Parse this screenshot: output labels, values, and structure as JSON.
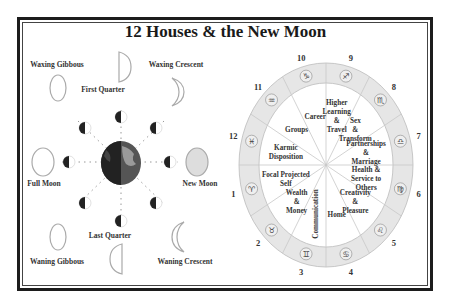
{
  "title": "12 Houses & the New Moon",
  "moon_phases": {
    "waxing_gibbous": "Waxing Gibbous",
    "first_quarter": "First Quarter",
    "waxing_crescent": "Waxing Crescent",
    "full_moon": "Full Moon",
    "new_moon": "New Moon",
    "waning_gibbous": "Waning Gibbous",
    "last_quarter": "Last Quarter",
    "waning_crescent": "Waning Crescent"
  },
  "houses": [
    {
      "number": "1",
      "sign": "♈",
      "meaning": [
        "Focal Projected",
        "Self"
      ]
    },
    {
      "number": "2",
      "sign": "♉",
      "meaning": [
        "Wealth",
        "&",
        "Money"
      ]
    },
    {
      "number": "3",
      "sign": "♊",
      "meaning": [
        "Communication"
      ]
    },
    {
      "number": "4",
      "sign": "♋",
      "meaning": [
        "Home"
      ]
    },
    {
      "number": "5",
      "sign": "♌",
      "meaning": [
        "Creativity",
        "&",
        "Pleasure"
      ]
    },
    {
      "number": "6",
      "sign": "♍",
      "meaning": [
        "Health &",
        "Service to",
        "Others"
      ]
    },
    {
      "number": "7",
      "sign": "♎",
      "meaning": [
        "Partnerships",
        "&",
        "Marriage"
      ]
    },
    {
      "number": "8",
      "sign": "♏",
      "meaning": [
        "Sex",
        "&",
        "Transform"
      ]
    },
    {
      "number": "9",
      "sign": "♐",
      "meaning": [
        "Higher",
        "Learning",
        "&",
        "Travel"
      ]
    },
    {
      "number": "10",
      "sign": "♑",
      "meaning": [
        "Career"
      ]
    },
    {
      "number": "11",
      "sign": "♒",
      "meaning": [
        "Groups"
      ]
    },
    {
      "number": "12",
      "sign": "♓",
      "meaning": [
        "Karmic",
        "Disposition"
      ]
    }
  ]
}
